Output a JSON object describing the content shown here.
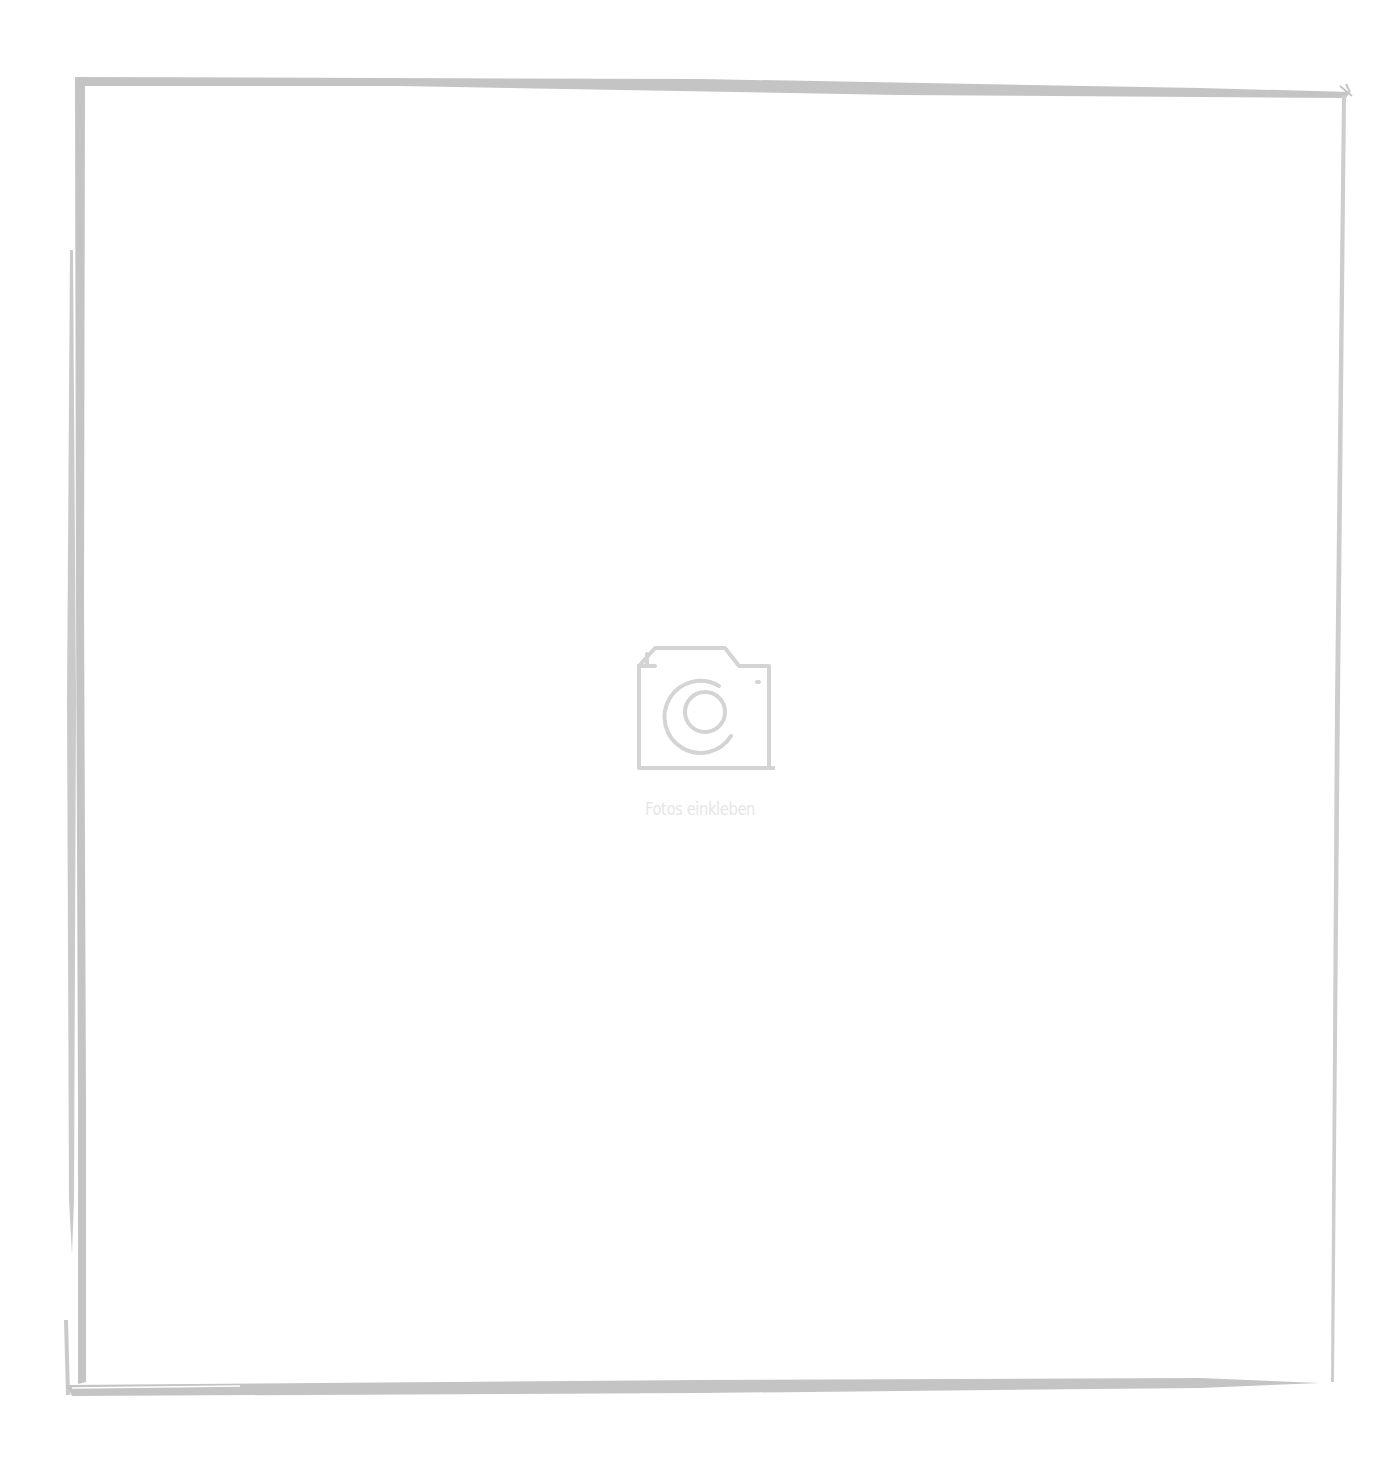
{
  "photo_slot": {
    "caption": "Fotos einkleben",
    "icon": "camera-icon"
  },
  "colors": {
    "frame": "#c2c2c2",
    "icon": "#d4d4d4",
    "caption": "#e6e6e6",
    "background": "#ffffff"
  }
}
